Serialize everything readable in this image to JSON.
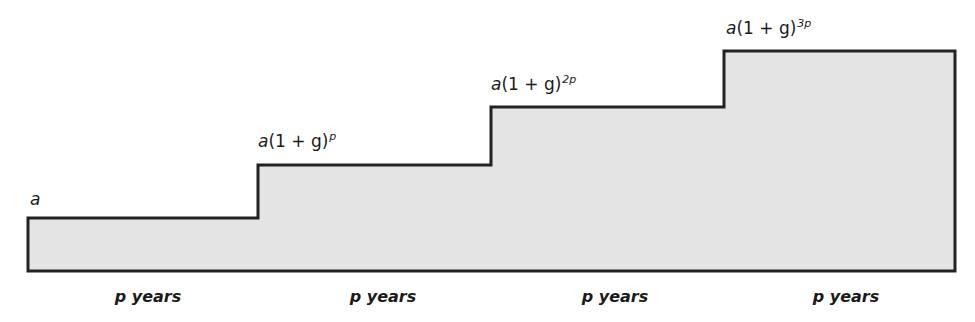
{
  "diagram": {
    "type": "step-function",
    "fill_color": "#e4e4e4",
    "stroke_color": "#222222",
    "steps": [
      {
        "label_base": "a",
        "label_paren": "",
        "label_exponent": "",
        "x_start": 28,
        "x_end": 258,
        "top_y": 218
      },
      {
        "label_base": "a",
        "label_paren": "(1 + g)",
        "label_exponent": "p",
        "x_start": 258,
        "x_end": 491,
        "top_y": 165
      },
      {
        "label_base": "a",
        "label_paren": "(1 + g)",
        "label_exponent": "2p",
        "x_start": 491,
        "x_end": 724,
        "top_y": 107
      },
      {
        "label_base": "a",
        "label_paren": "(1 + g)",
        "label_exponent": "3p",
        "x_start": 724,
        "x_end": 955,
        "top_y": 51
      }
    ],
    "baseline_y": 271,
    "period_labels": [
      {
        "p": "p",
        "text": " years",
        "center_x": 148
      },
      {
        "p": "p",
        "text": " years",
        "center_x": 383
      },
      {
        "p": "p",
        "text": " years",
        "center_x": 615
      },
      {
        "p": "p",
        "text": " years",
        "center_x": 846
      }
    ]
  }
}
